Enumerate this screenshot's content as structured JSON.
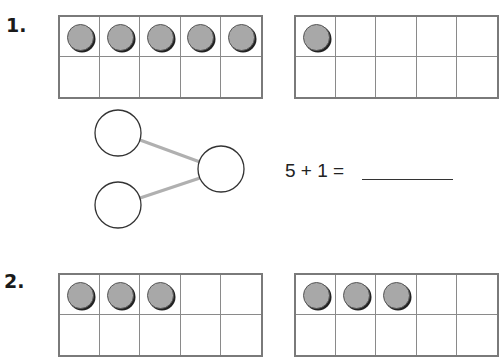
{
  "problems": [
    {
      "number": "1.",
      "ten_frames": [
        {
          "filled": [
            true,
            true,
            true,
            true,
            true,
            false,
            false,
            false,
            false,
            false
          ]
        },
        {
          "filled": [
            true,
            false,
            false,
            false,
            false,
            false,
            false,
            false,
            false,
            false
          ]
        }
      ],
      "number_bond": {
        "whole": "",
        "part1": "",
        "part2": ""
      },
      "equation": "5 + 1 =",
      "answer": ""
    },
    {
      "number": "2.",
      "ten_frames": [
        {
          "filled": [
            true,
            true,
            true,
            false,
            false,
            false,
            false,
            false,
            false,
            false
          ]
        },
        {
          "filled": [
            true,
            true,
            true,
            false,
            false,
            false,
            false,
            false,
            false,
            false
          ]
        }
      ]
    }
  ],
  "colors": {
    "counter": "#a8a8a8",
    "frame_border": "#7a7a7a",
    "bond_line": "#b0b0b0"
  }
}
